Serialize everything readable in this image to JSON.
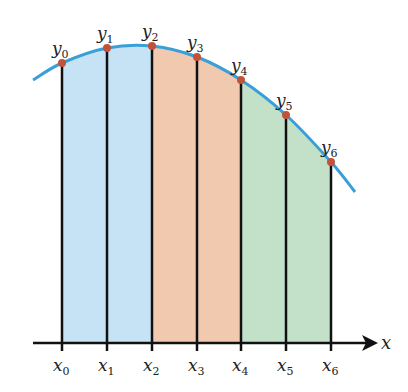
{
  "diagram": {
    "type": "simpson-rule-partition",
    "axis_label": "x",
    "colors": {
      "curve": "#3a9fd8",
      "point": "#c0533a",
      "region1": "#c6e2f5",
      "region2": "#f0c9ae",
      "region3": "#c3e1c9",
      "lines": "#111111"
    },
    "points": [
      {
        "x_label": "x",
        "x_sub": "0",
        "y_label": "y",
        "y_sub": "0",
        "px": 62,
        "py": 63
      },
      {
        "x_label": "x",
        "x_sub": "1",
        "y_label": "y",
        "y_sub": "1",
        "px": 107,
        "py": 48
      },
      {
        "x_label": "x",
        "x_sub": "2",
        "y_label": "y",
        "y_sub": "2",
        "px": 152,
        "py": 46
      },
      {
        "x_label": "x",
        "x_sub": "3",
        "y_label": "y",
        "y_sub": "3",
        "px": 197,
        "py": 57
      },
      {
        "x_label": "x",
        "x_sub": "4",
        "y_label": "y",
        "y_sub": "4",
        "px": 241,
        "py": 80
      },
      {
        "x_label": "x",
        "x_sub": "5",
        "y_label": "y",
        "y_sub": "5",
        "px": 286,
        "py": 115
      },
      {
        "x_label": "x",
        "x_sub": "6",
        "y_label": "y",
        "y_sub": "6",
        "px": 331,
        "py": 162
      }
    ]
  }
}
